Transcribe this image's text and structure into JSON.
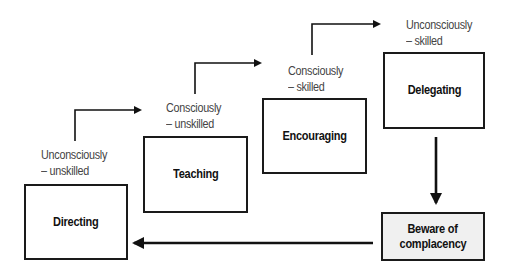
{
  "diagram": {
    "type": "staircase-flow",
    "boxes": [
      {
        "id": "directing",
        "label": "Directing",
        "stage_line1": "Unconsciously",
        "stage_line2": "– unskilled"
      },
      {
        "id": "teaching",
        "label": "Teaching",
        "stage_line1": "Consciously",
        "stage_line2": "– unskilled"
      },
      {
        "id": "encouraging",
        "label": "Encouraging",
        "stage_line1": "Consciously",
        "stage_line2": "– skilled"
      },
      {
        "id": "delegating",
        "label": "Delegating",
        "stage_line1": "Unconsciously",
        "stage_line2": "– skilled"
      },
      {
        "id": "complacency",
        "label_line1": "Beware of",
        "label_line2": "complacency"
      }
    ],
    "edges": [
      {
        "from": "directing",
        "to": "teaching"
      },
      {
        "from": "teaching",
        "to": "encouraging"
      },
      {
        "from": "encouraging",
        "to": "delegating"
      },
      {
        "from": "delegating",
        "to": "complacency"
      },
      {
        "from": "complacency",
        "to": "directing"
      }
    ],
    "colors": {
      "line": "#111111",
      "box_border": "#1a1a1a",
      "shaded_fill": "#f0f0f0",
      "stage_text": "#444444"
    }
  }
}
